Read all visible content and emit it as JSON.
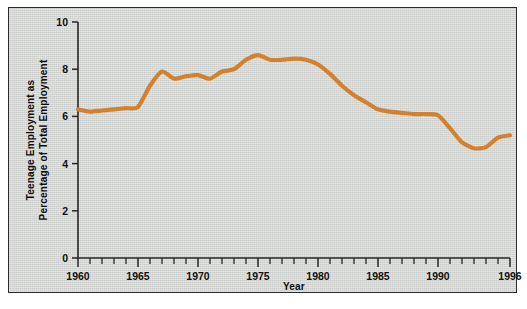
{
  "figure": {
    "background_color": "#d2d4d2",
    "frame_color": "#2b2b2b"
  },
  "chart_data": {
    "type": "line",
    "title": "",
    "xlabel": "Year",
    "ylabel": "Teenage Employment as Percentage of Total Employment",
    "ylabel_line1": "Teenage Employment as",
    "ylabel_line2": "Percentage of Total Employment",
    "series_color": "#d4812e",
    "grid": false,
    "legend": "none",
    "xlim": [
      1960,
      1996
    ],
    "ylim": [
      0,
      10
    ],
    "ytick_labels": [
      "0",
      "2",
      "4",
      "6",
      "8",
      "10"
    ],
    "yticks": [
      0,
      2,
      4,
      6,
      8,
      10
    ],
    "xtick_labels": [
      "1960",
      "1965",
      "1970",
      "1975",
      "1980",
      "1985",
      "1990",
      "1996"
    ],
    "xticks_major": [
      1960,
      1965,
      1970,
      1975,
      1980,
      1985,
      1990,
      1996
    ],
    "x": [
      1960,
      1961,
      1962,
      1963,
      1964,
      1965,
      1966,
      1967,
      1968,
      1969,
      1970,
      1971,
      1972,
      1973,
      1974,
      1975,
      1976,
      1977,
      1978,
      1979,
      1980,
      1981,
      1982,
      1983,
      1984,
      1985,
      1986,
      1987,
      1988,
      1989,
      1990,
      1991,
      1992,
      1993,
      1994,
      1995,
      1996
    ],
    "values": [
      6.3,
      6.2,
      6.25,
      6.3,
      6.35,
      6.4,
      7.3,
      7.9,
      7.6,
      7.7,
      7.75,
      7.6,
      7.9,
      8.0,
      8.4,
      8.6,
      8.4,
      8.4,
      8.45,
      8.4,
      8.2,
      7.8,
      7.3,
      6.9,
      6.6,
      6.3,
      6.2,
      6.15,
      6.1,
      6.1,
      6.05,
      5.5,
      4.9,
      4.65,
      4.7,
      5.1,
      5.2
    ]
  }
}
